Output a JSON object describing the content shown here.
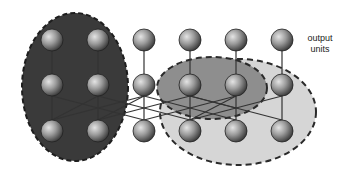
{
  "labels": {
    "output_line1": "output",
    "output_line2": "units"
  },
  "colors": {
    "background": "#ffffff",
    "dark_region": "#3a3a3a",
    "medium_region": "#8e8e8e",
    "light_region": "#d6d6d6",
    "dash_border": "#2a2a2a",
    "connection": "#333333",
    "neuron_light": "#d8d8d8",
    "neuron_dark": "#2e2e2e"
  },
  "network": {
    "columns_x": [
      52,
      98,
      144,
      190,
      236,
      282
    ],
    "rows_y": [
      40,
      85,
      131
    ],
    "neuron_radius": 11,
    "rows": [
      "output units",
      "hidden units",
      "input units"
    ]
  },
  "regions": [
    {
      "name": "dark-left-region",
      "cx": 75,
      "cy": 87,
      "rx": 53,
      "ry": 74
    },
    {
      "name": "light-right-region",
      "cx": 238,
      "cy": 112,
      "rx": 78,
      "ry": 53
    },
    {
      "name": "medium-center-region",
      "cx": 212,
      "cy": 88,
      "rx": 55,
      "ry": 31
    }
  ]
}
